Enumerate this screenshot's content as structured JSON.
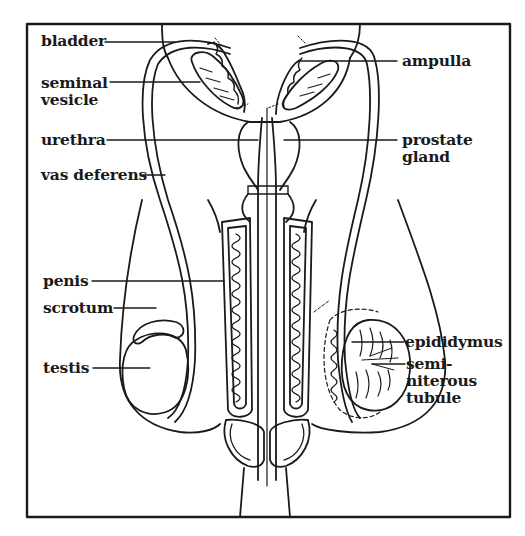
{
  "diagram": {
    "labels": {
      "bladder": "bladder",
      "seminal_vesicle": "seminal\nvesicle",
      "urethra": "urethra",
      "vas_deferens": "vas deferens",
      "penis": "penis",
      "scrotum": "scrotum",
      "testis": "testis",
      "ampulla": "ampulla",
      "prostate_gland": "prostate\ngland",
      "epididymus": "epididymus",
      "seminiferous_tubule": "semi-\nniterous\ntubule"
    },
    "colors": {
      "line": "#1a1a1a",
      "background": "#ffffff"
    }
  }
}
